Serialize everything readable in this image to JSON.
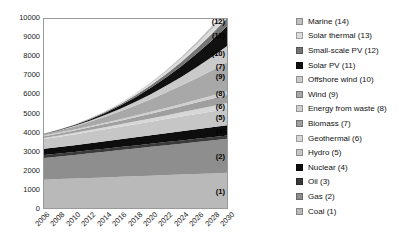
{
  "chart_data": {
    "type": "area",
    "stacked": true,
    "title": "",
    "subtitle": "",
    "xlabel": "",
    "ylabel": "",
    "xlim": [
      2006,
      2030
    ],
    "ylim": [
      0,
      10000
    ],
    "grid": false,
    "legend_position": "right",
    "x": [
      2006,
      2008,
      2010,
      2012,
      2014,
      2016,
      2018,
      2020,
      2022,
      2024,
      2026,
      2028,
      2030
    ],
    "x_tick_labels": [
      "2006",
      "2008",
      "2010",
      "2012",
      "2014",
      "2016",
      "2018",
      "2020",
      "2022",
      "2024",
      "2026",
      "2028",
      "2030"
    ],
    "y_tick_labels": [
      "0",
      "1000",
      "2000",
      "3000",
      "4000",
      "5000",
      "6000",
      "7000",
      "8000",
      "9000",
      "10000"
    ],
    "y_ticks": [
      0,
      1000,
      2000,
      3000,
      4000,
      5000,
      6000,
      7000,
      8000,
      9000,
      10000
    ],
    "series": [
      {
        "name": "Coal (1)",
        "index": 1,
        "color": "#b9b9b9",
        "values": [
          1500,
          1530,
          1560,
          1590,
          1620,
          1650,
          1680,
          1710,
          1740,
          1770,
          1800,
          1830,
          1860
        ]
      },
      {
        "name": "Gas (2)",
        "index": 2,
        "color": "#8e8e8e",
        "values": [
          1150,
          1200,
          1250,
          1305,
          1360,
          1415,
          1470,
          1525,
          1580,
          1635,
          1690,
          1745,
          1800
        ]
      },
      {
        "name": "Oil (3)",
        "index": 3,
        "color": "#3a3a3a",
        "values": [
          150,
          152,
          154,
          156,
          158,
          160,
          162,
          164,
          166,
          168,
          170,
          172,
          175
        ]
      },
      {
        "name": "Nuclear (4)",
        "index": 4,
        "color": "#0d0d0d",
        "values": [
          330,
          345,
          360,
          378,
          396,
          414,
          432,
          450,
          468,
          486,
          504,
          522,
          540
        ]
      },
      {
        "name": "Hydro (5)",
        "index": 5,
        "color": "#c6c6c6",
        "values": [
          520,
          545,
          570,
          600,
          630,
          660,
          690,
          720,
          750,
          780,
          810,
          840,
          870
        ]
      },
      {
        "name": "Geothermal (6)",
        "index": 6,
        "color": "#d7d7d7",
        "values": [
          60,
          70,
          82,
          96,
          112,
          130,
          150,
          172,
          196,
          222,
          250,
          280,
          312
        ]
      },
      {
        "name": "Biomass (7)",
        "index": 7,
        "color": "#9f9f9f",
        "values": [
          90,
          105,
          122,
          142,
          165,
          190,
          218,
          248,
          281,
          316,
          354,
          394,
          436
        ]
      },
      {
        "name": "Energy from waste (8)",
        "index": 8,
        "color": "#cfcfcf",
        "values": [
          40,
          46,
          53,
          61,
          70,
          80,
          91,
          103,
          116,
          130,
          145,
          161,
          178
        ]
      },
      {
        "name": "Wind (9)",
        "index": 9,
        "color": "#a8a8a8",
        "values": [
          70,
          110,
          165,
          235,
          320,
          420,
          535,
          665,
          810,
          970,
          1145,
          1335,
          1540
        ]
      },
      {
        "name": "Offshore wind (10)",
        "index": 10,
        "color": "#cacaca",
        "values": [
          8,
          16,
          30,
          52,
          85,
          130,
          190,
          265,
          355,
          460,
          580,
          715,
          865
        ]
      },
      {
        "name": "Solar PV (11)",
        "index": 11,
        "color": "#111111",
        "values": [
          10,
          22,
          42,
          72,
          115,
          172,
          245,
          335,
          442,
          566,
          707,
          865,
          1040
        ]
      },
      {
        "name": "Small-scale PV (12)",
        "index": 12,
        "color": "#757575",
        "values": [
          5,
          10,
          18,
          30,
          47,
          70,
          99,
          135,
          178,
          228,
          285,
          349,
          420
        ]
      },
      {
        "name": "Solar thermal (13)",
        "index": 13,
        "color": "#dcdcdc",
        "values": [
          2,
          5,
          10,
          18,
          30,
          46,
          67,
          93,
          124,
          160,
          201,
          247,
          298
        ]
      },
      {
        "name": "Marine (14)",
        "index": 14,
        "color": "#c0c0c0",
        "values": [
          1,
          2,
          4,
          8,
          14,
          23,
          35,
          51,
          71,
          95,
          123,
          155,
          191
        ]
      }
    ],
    "plot_annotations": [
      {
        "label": "(14)",
        "series": "Marine (14)"
      },
      {
        "label": "(13)",
        "series": "Solar thermal (13)"
      },
      {
        "label": "(12)",
        "series": "Small-scale PV (12)"
      },
      {
        "label": "(11)",
        "series": "Solar PV (11)"
      },
      {
        "label": "(10)",
        "series": "Offshore wind (10)"
      },
      {
        "label": "(9)",
        "series": "Wind (9)"
      },
      {
        "label": "(8)",
        "series": "Energy from waste (8)"
      },
      {
        "label": "(7)",
        "series": "Biomass (7)"
      },
      {
        "label": "(6)",
        "series": "Geothermal (6)"
      },
      {
        "label": "(5)",
        "series": "Hydro (5)"
      },
      {
        "label": "(4)",
        "series": "Nuclear (4)"
      },
      {
        "label": "(3)",
        "series": "Oil (3)"
      },
      {
        "label": "(2)",
        "series": "Gas (2)"
      },
      {
        "label": "(1)",
        "series": "Coal (1)"
      }
    ]
  },
  "legend": {
    "items": [
      {
        "label": "Marine (14)",
        "color": "#c0c0c0"
      },
      {
        "label": "Solar thermal (13)",
        "color": "#dcdcdc"
      },
      {
        "label": "Small-scale PV (12)",
        "color": "#757575"
      },
      {
        "label": "Solar PV (11)",
        "color": "#111111"
      },
      {
        "label": "Offshore wind (10)",
        "color": "#cacaca"
      },
      {
        "label": "Wind (9)",
        "color": "#a8a8a8"
      },
      {
        "label": "Energy from waste (8)",
        "color": "#cfcfcf"
      },
      {
        "label": "Biomass (7)",
        "color": "#9f9f9f"
      },
      {
        "label": "Geothermal (6)",
        "color": "#d7d7d7"
      },
      {
        "label": "Hydro (5)",
        "color": "#c6c6c6"
      },
      {
        "label": "Nuclear (4)",
        "color": "#0d0d0d"
      },
      {
        "label": "Oil (3)",
        "color": "#3a3a3a"
      },
      {
        "label": "Gas (2)",
        "color": "#8e8e8e"
      },
      {
        "label": "Coal (1)",
        "color": "#b9b9b9"
      }
    ]
  }
}
